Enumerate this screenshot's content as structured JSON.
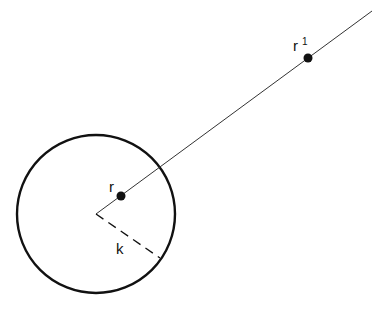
{
  "diagram": {
    "labels": {
      "point_inner": "r",
      "point_outer": "r",
      "point_outer_superscript": "1",
      "radius": "k"
    },
    "geometry": {
      "circle": {
        "cx": 96,
        "cy": 214,
        "r": 79
      },
      "ray_end": {
        "x": 372,
        "y": 11
      },
      "point_r": {
        "x": 121,
        "y": 196
      },
      "point_r_prime": {
        "x": 308,
        "y": 58
      },
      "radius_end": {
        "x": 160,
        "y": 258
      }
    },
    "colors": {
      "stroke": "#111111",
      "background": "#ffffff"
    }
  }
}
